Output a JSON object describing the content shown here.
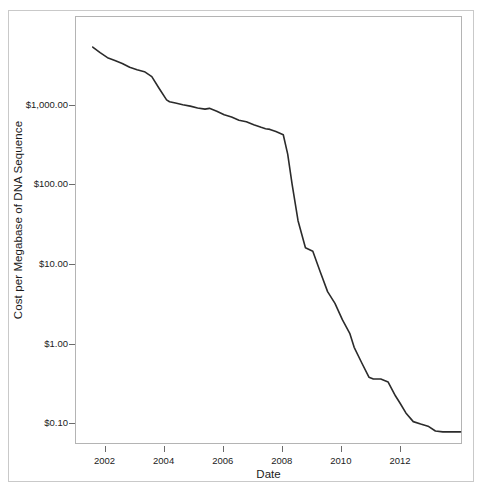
{
  "chart_data": {
    "type": "line",
    "title": "",
    "xlabel": "Date",
    "ylabel": "Cost per Megabase of DNA Sequence",
    "grid": false,
    "legend": false,
    "yscale": "log",
    "xlim": [
      2001.0,
      2014.1
    ],
    "ylim": [
      0.055,
      13000
    ],
    "y_tick_values": [
      1000,
      100,
      10,
      1,
      0.1
    ],
    "y_tick_labels": [
      "$1,000.00",
      "$100.00",
      "$10.00",
      "$1.00",
      "$0.10"
    ],
    "x_tick_values": [
      2002,
      2004,
      2006,
      2008,
      2010,
      2012
    ],
    "x_tick_labels": [
      "2002",
      "2004",
      "2006",
      "2008",
      "2010",
      "2012"
    ],
    "series": [
      {
        "name": "Cost per Megabase",
        "color": "#2b2b2b",
        "x": [
          2001.6,
          2001.85,
          2002.1,
          2002.35,
          2002.6,
          2002.85,
          2003.1,
          2003.35,
          2003.6,
          2003.85,
          2004.1,
          2004.2,
          2004.4,
          2004.65,
          2004.9,
          2005.15,
          2005.4,
          2005.55,
          2005.8,
          2006.05,
          2006.3,
          2006.55,
          2006.8,
          2007.05,
          2007.3,
          2007.45,
          2007.6,
          2007.8,
          2008.05,
          2008.2,
          2008.35,
          2008.55,
          2008.8,
          2009.05,
          2009.3,
          2009.55,
          2009.8,
          2010.05,
          2010.3,
          2010.45,
          2010.7,
          2010.95,
          2011.1,
          2011.35,
          2011.6,
          2011.85,
          2012.0,
          2012.2,
          2012.45,
          2012.7,
          2012.95,
          2013.2,
          2013.45,
          2013.7,
          2014.05
        ],
        "y": [
          5290,
          4500,
          3900,
          3600,
          3300,
          2950,
          2750,
          2600,
          2250,
          1600,
          1150,
          1090,
          1050,
          1000,
          960,
          910,
          880,
          900,
          830,
          750,
          700,
          640,
          610,
          560,
          520,
          500,
          490,
          460,
          420,
          240,
          100,
          35,
          16,
          14.5,
          8.0,
          4.5,
          3.2,
          2.0,
          1.35,
          0.9,
          0.58,
          0.38,
          0.36,
          0.36,
          0.33,
          0.22,
          0.18,
          0.135,
          0.105,
          0.098,
          0.092,
          0.08,
          0.078,
          0.078,
          0.078
        ]
      }
    ]
  },
  "axes": {
    "y_title": "Cost per Megabase of DNA Sequence",
    "x_title": "Date",
    "y_labels": [
      "$1,000.00",
      "$100.00",
      "$10.00",
      "$1.00",
      "$0.10"
    ],
    "x_labels": [
      "2002",
      "2004",
      "2006",
      "2008",
      "2010",
      "2012"
    ]
  }
}
